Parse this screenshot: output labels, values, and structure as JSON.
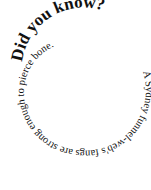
{
  "heading": "Did you know?",
  "fact": "A Sydney funnel-web's fangs are strong enough to pierce bone.",
  "colors": {
    "text": "#111111",
    "background": "#ffffff"
  }
}
